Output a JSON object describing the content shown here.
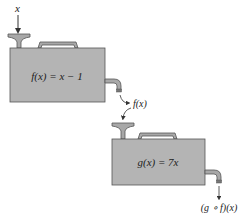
{
  "diagram": {
    "type": "function-composition-machines",
    "input_label": "x",
    "machine1": {
      "label": "f(x) = x − 1",
      "color": "#b4b4b4"
    },
    "intermediate_label": "f(x)",
    "machine2": {
      "label": "g(x) = 7x",
      "color": "#b4b4b4"
    },
    "output_label": "(g ∘ f)(x)"
  }
}
